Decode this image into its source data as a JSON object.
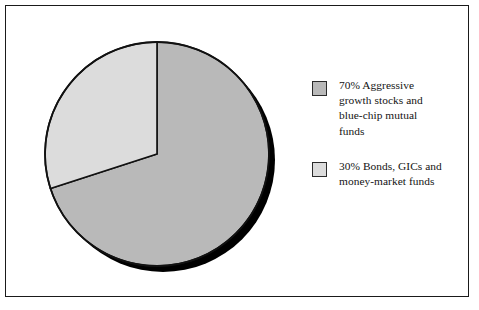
{
  "figure": {
    "width": 479,
    "height": 310,
    "background": "#ffffff",
    "frame_color": "#1a1a1a"
  },
  "chart_data": {
    "type": "pie",
    "title": "",
    "subtitle": "",
    "xlabel": "",
    "ylabel": "",
    "grid": false,
    "legend_position": "right",
    "start_angle_deg": 0,
    "direction": "clockwise",
    "three_d_shadow": true,
    "categories": [
      "Aggressive growth stocks and blue-chip mutual funds",
      "Bonds, GICs and money-market funds"
    ],
    "values": [
      70,
      30
    ],
    "value_unit": "%",
    "slices": [
      {
        "label": "70% Aggressive growth stocks and blue-chip mutual funds",
        "value": 70,
        "percent_text": "70%",
        "color": "#b9b9b9",
        "edge_color": "#111111"
      },
      {
        "label": "30% Bonds, GICs and money-market funds",
        "value": 30,
        "percent_text": "30%",
        "color": "#dcdcdc",
        "edge_color": "#111111"
      }
    ]
  },
  "legend": {
    "items": [
      {
        "swatch_name": "legend-swatch-aggressive-growth",
        "color": "#b9b9b9",
        "label": "70% Aggressive\ngrowth stocks and\nblue-chip mutual\nfunds"
      },
      {
        "swatch_name": "legend-swatch-bonds-gics",
        "color": "#dcdcdc",
        "label": "30% Bonds, GICs and\nmoney-market funds"
      }
    ]
  }
}
